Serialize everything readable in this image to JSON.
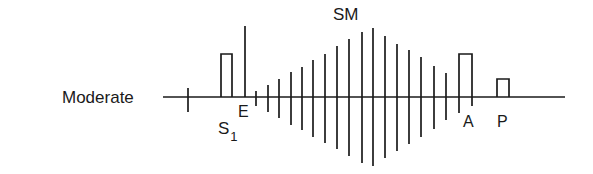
{
  "diagram": {
    "row_label": "Moderate",
    "labels": {
      "s1": "S",
      "s1_sub": "1",
      "e": "E",
      "sm": "SM",
      "a": "A",
      "p": "P"
    },
    "baseline": {
      "x1": 163,
      "x2": 565,
      "y": 97
    },
    "ink_color": "#1a1a1a",
    "ticks": [
      {
        "x": 188,
        "top": 88,
        "bottom": 112
      },
      {
        "x": 245,
        "top": 26,
        "bottom": 97
      },
      {
        "x": 256,
        "top": 91,
        "bottom": 106
      },
      {
        "x": 268,
        "top": 85,
        "bottom": 112
      },
      {
        "x": 279,
        "top": 79,
        "bottom": 118
      },
      {
        "x": 291,
        "top": 72,
        "bottom": 125
      },
      {
        "x": 302,
        "top": 67,
        "bottom": 130
      },
      {
        "x": 313,
        "top": 60,
        "bottom": 137
      },
      {
        "x": 325,
        "top": 54,
        "bottom": 143
      },
      {
        "x": 337,
        "top": 46,
        "bottom": 149
      },
      {
        "x": 349,
        "top": 39,
        "bottom": 156
      },
      {
        "x": 362,
        "top": 32,
        "bottom": 163
      },
      {
        "x": 373,
        "top": 28,
        "bottom": 166
      },
      {
        "x": 385,
        "top": 36,
        "bottom": 158
      },
      {
        "x": 397,
        "top": 44,
        "bottom": 151
      },
      {
        "x": 409,
        "top": 50,
        "bottom": 144
      },
      {
        "x": 421,
        "top": 57,
        "bottom": 137
      },
      {
        "x": 434,
        "top": 66,
        "bottom": 129
      },
      {
        "x": 446,
        "top": 73,
        "bottom": 120
      }
    ],
    "rects": [
      {
        "name": "s1-pulse",
        "x1": 221,
        "x2": 232,
        "top": 54
      },
      {
        "name": "a-pulse",
        "x1": 459,
        "x2": 472,
        "top": 54,
        "left_tail": 113,
        "right_tail": 106
      },
      {
        "name": "p-pulse",
        "x1": 497,
        "x2": 509,
        "top": 79
      }
    ]
  }
}
